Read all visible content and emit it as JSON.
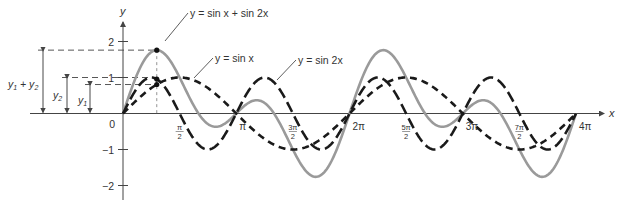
{
  "chart_data": {
    "type": "line",
    "title": "",
    "xlabel": "x",
    "ylabel": "y",
    "xlim": [
      0,
      12.566
    ],
    "ylim": [
      -2.2,
      2.4
    ],
    "grid": false,
    "x_ticks": [
      {
        "value": 1.5708,
        "label_num": "π",
        "label_den": "2",
        "frac": true
      },
      {
        "value": 3.1416,
        "label": "π",
        "frac": false
      },
      {
        "value": 4.7124,
        "label_num": "3π",
        "label_den": "2",
        "frac": true
      },
      {
        "value": 6.2832,
        "label": "2π",
        "frac": false
      },
      {
        "value": 7.854,
        "label_num": "5π",
        "label_den": "2",
        "frac": true
      },
      {
        "value": 9.4248,
        "label": "3π",
        "frac": false
      },
      {
        "value": 10.9956,
        "label_num": "7π",
        "label_den": "2",
        "frac": true
      },
      {
        "value": 12.566,
        "label": "4π",
        "frac": false
      }
    ],
    "y_ticks": [
      {
        "value": 2,
        "label": "2"
      },
      {
        "value": 1,
        "label": "1"
      },
      {
        "value": -1,
        "label": "−1"
      },
      {
        "value": -2,
        "label": "−2"
      }
    ],
    "origin_label": "0",
    "series": [
      {
        "name": "y = sin x",
        "function": "sin(x)",
        "style": "dashed",
        "color": "#1a1a1a"
      },
      {
        "name": "y = sin 2x",
        "function": "sin(2x)",
        "style": "long-dashed",
        "color": "#1a1a1a"
      },
      {
        "name": "y = sin x + sin 2x",
        "function": "sin(x)+sin(2x)",
        "style": "solid",
        "color": "#999999"
      }
    ],
    "annotations": [
      {
        "text": "y = sin x + sin 2x",
        "points_to_series": 2
      },
      {
        "text": "y = sin x",
        "points_to_series": 0
      },
      {
        "text": "y = sin 2x",
        "points_to_series": 1
      },
      {
        "text": "y₁ + y₂",
        "type": "measurement"
      },
      {
        "text": "y₂",
        "type": "measurement"
      },
      {
        "text": "y₁",
        "type": "measurement"
      }
    ],
    "highlight_x": 0.9363,
    "highlight_values": {
      "y1": 0.805,
      "y2": 0.955,
      "y1_plus_y2": 1.76
    }
  },
  "labels": {
    "sum_curve": "y = sin x + sin 2x",
    "sin_curve": "y = sin x",
    "sin2_curve": "y = sin 2x",
    "meas_sum_a": "y",
    "meas_sum_a_sub": "1",
    "meas_sum_plus": " + y",
    "meas_sum_b_sub": "2",
    "meas_y2": "y",
    "meas_y2_sub": "2",
    "meas_y1": "y",
    "meas_y1_sub": "1",
    "axis_x": "x",
    "axis_y": "y"
  },
  "colors": {
    "ink": "#1a1a1a",
    "sum_curve": "#9a9a9a",
    "axis": "#555555"
  }
}
